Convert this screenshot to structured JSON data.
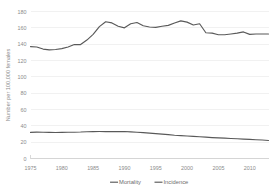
{
  "chart_data": {
    "type": "line",
    "title": "",
    "xlabel": "",
    "ylabel": "Number per 100,000 females",
    "ylim": [
      0,
      180
    ],
    "yticks": [
      0,
      20,
      40,
      60,
      80,
      100,
      120,
      140,
      160,
      180
    ],
    "ytick_labels": [
      "0",
      "20",
      "40",
      "60",
      "80",
      "100",
      "120",
      "140",
      "160",
      "180"
    ],
    "xlim": [
      1975,
      2013
    ],
    "xticks": [
      1975,
      1980,
      1985,
      1990,
      1995,
      2000,
      2005,
      2010
    ],
    "xtick_labels": [
      "1975",
      "1980",
      "1985",
      "1990",
      "1995",
      "2000",
      "2005",
      "2010"
    ],
    "grid": "horizontal",
    "legend_position": "bottom-center",
    "x": [
      1975,
      1976,
      1977,
      1978,
      1979,
      1980,
      1981,
      1982,
      1983,
      1984,
      1985,
      1986,
      1987,
      1988,
      1989,
      1990,
      1991,
      1992,
      1993,
      1994,
      1995,
      1996,
      1997,
      1998,
      1999,
      2000,
      2001,
      2002,
      2003,
      2004,
      2005,
      2006,
      2007,
      2008,
      2009,
      2010,
      2011,
      2012,
      2013
    ],
    "series": [
      {
        "name": "Mortality",
        "color": "#595959",
        "values": [
          32.0,
          32.3,
          32.1,
          32.0,
          31.9,
          32.0,
          32.1,
          32.2,
          32.4,
          32.8,
          32.9,
          33.0,
          33.0,
          32.9,
          32.9,
          33.0,
          32.6,
          32.1,
          31.6,
          31.0,
          30.4,
          29.8,
          29.2,
          28.5,
          28.0,
          27.5,
          27.1,
          26.6,
          26.1,
          25.6,
          25.2,
          24.9,
          24.5,
          24.2,
          23.8,
          23.4,
          23.0,
          22.6,
          22.1
        ]
      },
      {
        "name": "Incidence",
        "color": "#595959",
        "values": [
          137.0,
          136.5,
          134.0,
          133.0,
          133.5,
          134.5,
          136.5,
          139.5,
          139.5,
          145.0,
          152.0,
          161.5,
          167.5,
          166.0,
          162.0,
          160.0,
          165.0,
          166.5,
          162.5,
          161.0,
          160.5,
          162.0,
          163.0,
          166.0,
          168.5,
          167.0,
          163.5,
          165.0,
          154.0,
          153.5,
          151.5,
          151.5,
          152.5,
          153.5,
          155.0,
          152.0,
          152.5,
          152.5,
          152.5
        ]
      }
    ],
    "legend": [
      {
        "label": "Mortality"
      },
      {
        "label": "Incidence"
      }
    ]
  }
}
